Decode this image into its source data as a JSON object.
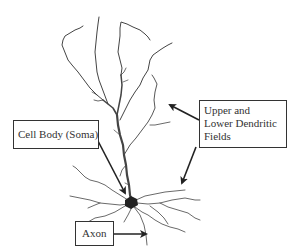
{
  "diagram": {
    "labels": {
      "soma": "Cell Body (Soma)",
      "dendrites_line1": "Upper and",
      "dendrites_line2": "Lower Dendritic",
      "dendrites_line3": "Fields",
      "axon": "Axon"
    },
    "colors": {
      "ink": "#333333",
      "dendrite": "#444444",
      "background": "#ffffff"
    }
  }
}
